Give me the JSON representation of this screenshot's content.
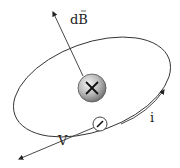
{
  "diagram": {
    "labels": {
      "field": "dB",
      "velocity": "V",
      "current": "i"
    },
    "nucleus": {
      "symbol": "+",
      "color": "#8a8a8a"
    },
    "electron": {
      "symbol": "−"
    },
    "colors": {
      "stroke": "#333333",
      "background": "#ffffff"
    }
  }
}
